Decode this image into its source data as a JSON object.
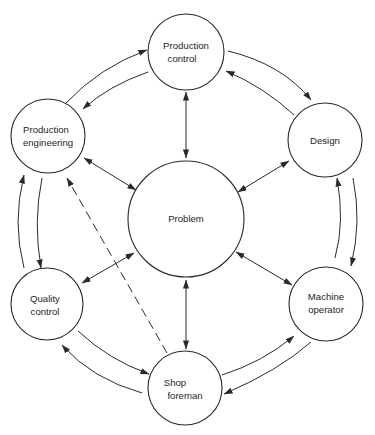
{
  "diagram": {
    "type": "cycle-with-hub",
    "colors": {
      "stroke": "#2a2a2a",
      "text": "#1e1e1e",
      "background": "#ffffff"
    },
    "nodes": {
      "problem": {
        "label": [
          "Problem"
        ],
        "cx": 186,
        "cy": 219,
        "r": 58
      },
      "production_control": {
        "label": [
          "Production",
          "control"
        ],
        "cx": 186,
        "cy": 52,
        "r": 38
      },
      "design": {
        "label": [
          "Design"
        ],
        "cx": 325,
        "cy": 140,
        "r": 37
      },
      "machine_operator": {
        "label": [
          "Machine",
          "operator"
        ],
        "cx": 326,
        "cy": 304,
        "r": 37
      },
      "shop_foreman": {
        "label": [
          "Shop",
          "foreman"
        ],
        "cx": 185,
        "cy": 388,
        "r": 37
      },
      "quality_control": {
        "label": [
          "Quality",
          "control"
        ],
        "cx": 47,
        "cy": 304,
        "r": 36
      },
      "production_engineering": {
        "label": [
          "Production",
          "engineering"
        ],
        "cx": 48,
        "cy": 136,
        "r": 37
      }
    },
    "edges": [
      {
        "from": "problem",
        "to": "production_control",
        "style": "solid",
        "arrows": "both"
      },
      {
        "from": "problem",
        "to": "design",
        "style": "solid",
        "arrows": "both"
      },
      {
        "from": "problem",
        "to": "machine_operator",
        "style": "solid",
        "arrows": "both"
      },
      {
        "from": "problem",
        "to": "shop_foreman",
        "style": "solid",
        "arrows": "both"
      },
      {
        "from": "problem",
        "to": "quality_control",
        "style": "solid",
        "arrows": "both"
      },
      {
        "from": "problem",
        "to": "production_engineering",
        "style": "solid",
        "arrows": "both"
      },
      {
        "from": "production_engineering",
        "to": "production_control",
        "style": "solid",
        "ring": "outer",
        "arrows": "end"
      },
      {
        "from": "production_control",
        "to": "design",
        "style": "solid",
        "ring": "outer",
        "arrows": "end"
      },
      {
        "from": "design",
        "to": "machine_operator",
        "style": "solid",
        "ring": "outer",
        "arrows": "end"
      },
      {
        "from": "machine_operator",
        "to": "shop_foreman",
        "style": "solid",
        "ring": "outer",
        "arrows": "end"
      },
      {
        "from": "shop_foreman",
        "to": "quality_control",
        "style": "solid",
        "ring": "outer",
        "arrows": "end"
      },
      {
        "from": "quality_control",
        "to": "production_engineering",
        "style": "solid",
        "ring": "outer",
        "arrows": "end"
      },
      {
        "from": "production_control",
        "to": "production_engineering",
        "style": "solid",
        "ring": "inner",
        "arrows": "end"
      },
      {
        "from": "design",
        "to": "production_control",
        "style": "solid",
        "ring": "inner",
        "arrows": "end"
      },
      {
        "from": "machine_operator",
        "to": "design",
        "style": "solid",
        "ring": "inner",
        "arrows": "end"
      },
      {
        "from": "shop_foreman",
        "to": "machine_operator",
        "style": "solid",
        "ring": "inner",
        "arrows": "end"
      },
      {
        "from": "quality_control",
        "to": "shop_foreman",
        "style": "solid",
        "ring": "inner",
        "arrows": "end"
      },
      {
        "from": "production_engineering",
        "to": "quality_control",
        "style": "solid",
        "ring": "inner",
        "arrows": "end"
      },
      {
        "from": "shop_foreman",
        "to": "production_engineering",
        "style": "dashed",
        "arrows": "end"
      }
    ]
  }
}
